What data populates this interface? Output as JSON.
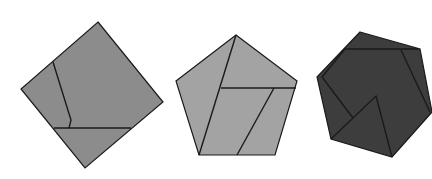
{
  "diagram": {
    "background": "#ffffff",
    "stroke": "#1a1a1a",
    "shapes": [
      {
        "name": "square",
        "fill": "#8c8c8c",
        "outline": "98,22 163,102 85,168 21,89",
        "dissection_lines": [
          "53,62 71,120 69,128",
          "54,128 131,128"
        ]
      },
      {
        "name": "pentagon",
        "fill": "#a3a3a3",
        "outline": "236,35 297,81 275,155 199,155 176,81",
        "dissection_lines": [
          "236,35 199,155",
          "221,88 296,88",
          "274,88 237,155"
        ]
      },
      {
        "name": "hexagon",
        "fill": "#3d3d3d",
        "outline": "360,32 420,49 432,112 392,157 331,139 317,77",
        "dissection_lines": [
          "345,49 418,49",
          "345,49 322,77 353,118",
          "331,139 376,96 392,157",
          "401,50 430,112"
        ]
      }
    ]
  }
}
